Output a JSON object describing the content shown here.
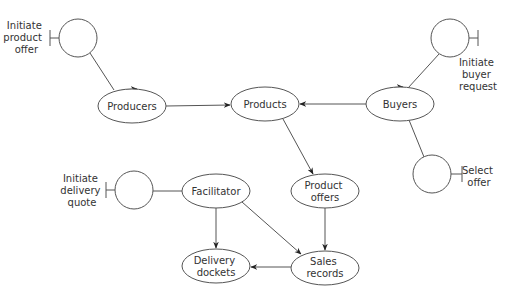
{
  "diagram": {
    "type": "object-relationship diagram",
    "entities": [
      {
        "id": "producers",
        "label": [
          "Producers"
        ],
        "cx": 132,
        "cy": 106
      },
      {
        "id": "products",
        "label": [
          "Products"
        ],
        "cx": 265,
        "cy": 104
      },
      {
        "id": "buyers",
        "label": [
          "Buyers"
        ],
        "cx": 400,
        "cy": 104
      },
      {
        "id": "facilitator",
        "label": [
          "Facilitator"
        ],
        "cx": 216,
        "cy": 191
      },
      {
        "id": "product-offers",
        "label": [
          "Product",
          "offers"
        ],
        "cx": 325,
        "cy": 191
      },
      {
        "id": "delivery-dockets",
        "label": [
          "Delivery",
          "dockets"
        ],
        "cx": 216,
        "cy": 266
      },
      {
        "id": "sales-records",
        "label": [
          "Sales",
          "records"
        ],
        "cx": 325,
        "cy": 268
      }
    ],
    "interfaces": [
      {
        "id": "initiate-product-offer",
        "label": [
          "Initiate",
          "product",
          "offer"
        ],
        "cx": 78,
        "cy": 38
      },
      {
        "id": "initiate-buyer-request",
        "label": [
          "Initiate",
          "buyer",
          "request"
        ],
        "cx": 450,
        "cy": 38
      },
      {
        "id": "select-offer",
        "label": [
          "Select",
          "offer"
        ],
        "cx": 432,
        "cy": 174
      },
      {
        "id": "initiate-delivery-quote",
        "label": [
          "Initiate",
          "delivery",
          "quote"
        ],
        "cx": 134,
        "cy": 190
      }
    ],
    "edges": [
      {
        "from": "initiate-product-offer",
        "to": "producers"
      },
      {
        "from": "producers",
        "to": "products",
        "arrow": true
      },
      {
        "from": "buyers",
        "to": "products",
        "arrow": true
      },
      {
        "from": "initiate-buyer-request",
        "to": "buyers"
      },
      {
        "from": "buyers",
        "to": "select-offer"
      },
      {
        "from": "products",
        "to": "product-offers",
        "arrow": true
      },
      {
        "from": "initiate-delivery-quote",
        "to": "facilitator"
      },
      {
        "from": "facilitator",
        "to": "delivery-dockets",
        "arrow": true
      },
      {
        "from": "facilitator",
        "to": "sales-records",
        "arrow": true
      },
      {
        "from": "product-offers",
        "to": "sales-records",
        "arrow": true
      },
      {
        "from": "sales-records",
        "to": "delivery-dockets",
        "arrow": true
      }
    ]
  },
  "labels": {
    "producers": "Producers",
    "products": "Products",
    "buyers": "Buyers",
    "facilitator": "Facilitator",
    "product_offers_1": "Product",
    "product_offers_2": "offers",
    "delivery_dockets_1": "Delivery",
    "delivery_dockets_2": "dockets",
    "sales_records_1": "Sales",
    "sales_records_2": "records",
    "ipo_1": "Initiate",
    "ipo_2": "product",
    "ipo_3": "offer",
    "ibr_1": "Initiate",
    "ibr_2": "buyer",
    "ibr_3": "request",
    "so_1": "Select",
    "so_2": "offer",
    "idq_1": "Initiate",
    "idq_2": "delivery",
    "idq_3": "quote"
  }
}
